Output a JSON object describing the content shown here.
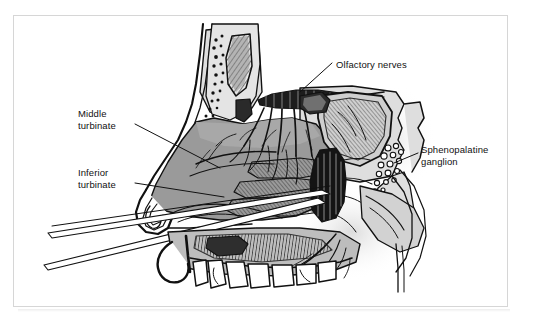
{
  "figure": {
    "kind": "anatomical-line-drawing",
    "background_color": "#ffffff",
    "frame_color": "#d6d6d6",
    "ink_color": "#111111",
    "mucosa_gray": "#9a9a9a",
    "bone_gray": "#d9d9d9",
    "shadow_gray": "#c2c2c2"
  },
  "labels": {
    "olfactory_nerves": "Olfactory nerves",
    "middle_turbinate": "Middle\nturbinate",
    "inferior_turbinate": "Inferior\nturbinate",
    "sphenopalatine_ganglion": "Sphenopalatine\nganglion"
  }
}
